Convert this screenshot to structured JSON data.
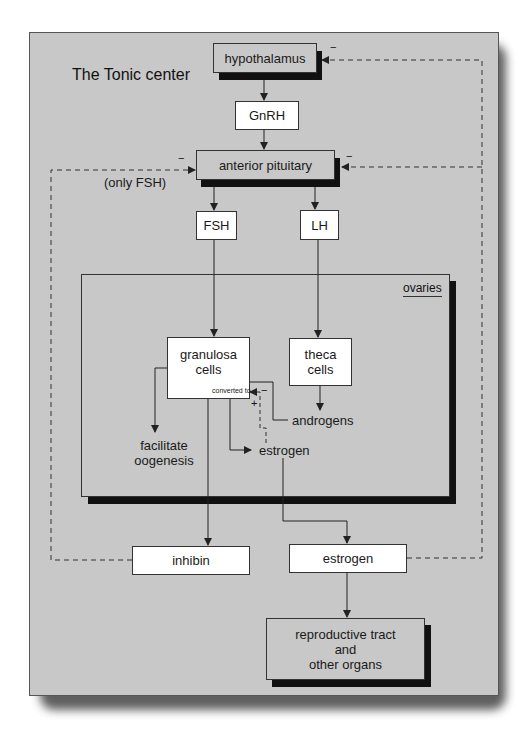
{
  "title": "The Tonic center",
  "nodes": {
    "hypothalamus": "hypothalamus",
    "gnrh": "GnRH",
    "anterior_pituitary": "anterior pituitary",
    "fsh": "FSH",
    "lh": "LH",
    "ovaries": "ovaries",
    "granulosa_line1": "granulosa",
    "granulosa_line2": "cells",
    "converted_to": "converted to",
    "theca_line1": "theca",
    "theca_line2": "cells",
    "androgens": "androgens",
    "estrogen_inner": "estrogen",
    "facilitate_line1": "facilitate",
    "facilitate_line2": "oogenesis",
    "inhibin": "inhibin",
    "estrogen_outer": "estrogen",
    "repro_line1": "reproductive tract",
    "repro_line2": "and",
    "repro_line3": "other organs"
  },
  "annotations": {
    "only_fsh": "(only FSH)",
    "minus": "−",
    "plus": "+"
  },
  "colors": {
    "panel": "#c8c8c8",
    "box_white": "#ffffff",
    "shadow": "#111111",
    "line": "#222222"
  }
}
